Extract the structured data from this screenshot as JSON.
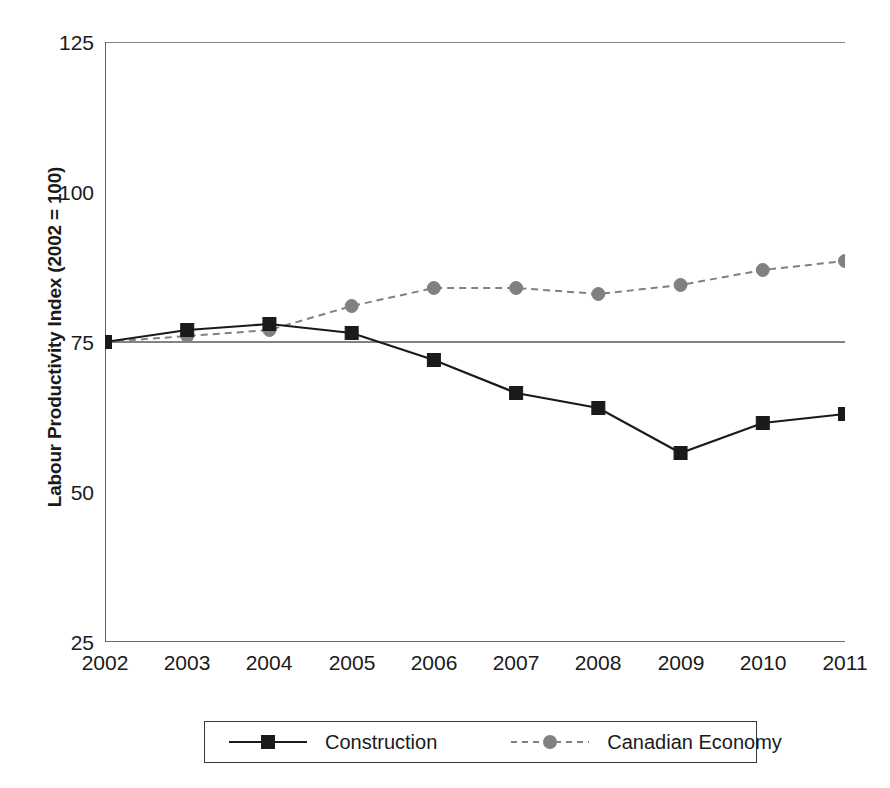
{
  "chart_data": {
    "type": "line",
    "title": "",
    "xlabel": "",
    "ylabel": "Labour Productivity Index (2002 = 100)",
    "categories": [
      "2002",
      "2003",
      "2004",
      "2005",
      "2006",
      "2007",
      "2008",
      "2009",
      "2010",
      "2011"
    ],
    "x": [
      2002,
      2003,
      2004,
      2005,
      2006,
      2007,
      2008,
      2009,
      2010,
      2011
    ],
    "xlim": [
      2002,
      2011
    ],
    "ylim": [
      25,
      125
    ],
    "yticks": [
      25,
      50,
      75,
      100,
      125
    ],
    "ytick_labels": [
      "25",
      "50",
      "75",
      "100",
      "125"
    ],
    "grid": "horizontal-at-75-and-125",
    "legend_position": "bottom",
    "series": [
      {
        "name": "Construction",
        "values": [
          75,
          77,
          78,
          76.5,
          72,
          66.5,
          64,
          56.5,
          61.5,
          63
        ],
        "color": "#1a1a1a",
        "line_style": "solid",
        "marker": "square"
      },
      {
        "name": "Canadian Economy",
        "values": [
          75,
          76,
          77,
          81,
          84,
          84,
          83,
          84.5,
          87,
          88.5
        ],
        "color": "#808080",
        "line_style": "dashed",
        "marker": "circle"
      }
    ]
  },
  "legend": {
    "entries": [
      {
        "label": "Construction"
      },
      {
        "label": "Canadian Economy"
      }
    ]
  },
  "colors": {
    "axis": "#3a3a3a",
    "gridline": "#5a5a5a",
    "construction": "#1a1a1a",
    "canadian_economy": "#808080",
    "background": "#ffffff"
  }
}
